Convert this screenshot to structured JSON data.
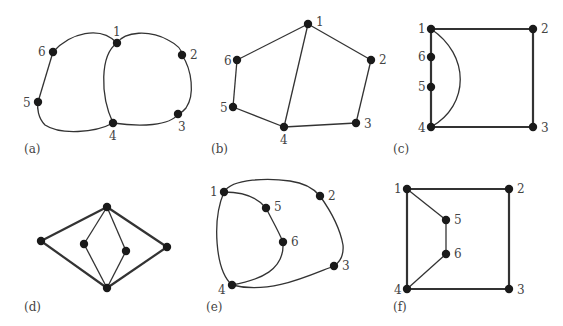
{
  "figure": {
    "panels": [
      {
        "id": "a",
        "caption": "(a)",
        "nodes": [
          {
            "label": "1"
          },
          {
            "label": "2"
          },
          {
            "label": "3"
          },
          {
            "label": "4"
          },
          {
            "label": "5"
          },
          {
            "label": "6"
          }
        ],
        "edges": [
          [
            "1",
            "2"
          ],
          [
            "2",
            "3"
          ],
          [
            "3",
            "4"
          ],
          [
            "4",
            "5"
          ],
          [
            "5",
            "6"
          ],
          [
            "6",
            "1"
          ],
          [
            "1",
            "4"
          ]
        ]
      },
      {
        "id": "b",
        "caption": "(b)",
        "nodes": [
          {
            "label": "1"
          },
          {
            "label": "2"
          },
          {
            "label": "3"
          },
          {
            "label": "4"
          },
          {
            "label": "5"
          },
          {
            "label": "6"
          }
        ],
        "edges": [
          [
            "1",
            "2"
          ],
          [
            "2",
            "3"
          ],
          [
            "3",
            "4"
          ],
          [
            "4",
            "5"
          ],
          [
            "5",
            "6"
          ],
          [
            "6",
            "1"
          ],
          [
            "1",
            "4"
          ]
        ]
      },
      {
        "id": "c",
        "caption": "(c)",
        "nodes": [
          {
            "label": "1"
          },
          {
            "label": "2"
          },
          {
            "label": "3"
          },
          {
            "label": "4"
          },
          {
            "label": "5"
          },
          {
            "label": "6"
          }
        ],
        "edges": [
          [
            "1",
            "2"
          ],
          [
            "2",
            "3"
          ],
          [
            "3",
            "4"
          ],
          [
            "4",
            "5"
          ],
          [
            "5",
            "6"
          ],
          [
            "6",
            "1"
          ],
          [
            "1",
            "4"
          ]
        ]
      },
      {
        "id": "d",
        "caption": "(d)",
        "nodes": [
          {
            "label": ""
          },
          {
            "label": ""
          },
          {
            "label": ""
          },
          {
            "label": ""
          },
          {
            "label": ""
          },
          {
            "label": ""
          }
        ],
        "edges": [
          [
            "top",
            "left"
          ],
          [
            "left",
            "bottom"
          ],
          [
            "bottom",
            "right"
          ],
          [
            "right",
            "top"
          ],
          [
            "top",
            "inner-left"
          ],
          [
            "inner-left",
            "bottom"
          ],
          [
            "top",
            "inner-right"
          ],
          [
            "inner-right",
            "bottom"
          ]
        ]
      },
      {
        "id": "e",
        "caption": "(e)",
        "nodes": [
          {
            "label": "1"
          },
          {
            "label": "2"
          },
          {
            "label": "3"
          },
          {
            "label": "4"
          },
          {
            "label": "5"
          },
          {
            "label": "6"
          }
        ],
        "edges": [
          [
            "1",
            "2"
          ],
          [
            "2",
            "3"
          ],
          [
            "3",
            "4"
          ],
          [
            "4",
            "1"
          ],
          [
            "1",
            "5"
          ],
          [
            "5",
            "6"
          ],
          [
            "6",
            "4"
          ]
        ]
      },
      {
        "id": "f",
        "caption": "(f)",
        "nodes": [
          {
            "label": "1"
          },
          {
            "label": "2"
          },
          {
            "label": "3"
          },
          {
            "label": "4"
          },
          {
            "label": "5"
          },
          {
            "label": "6"
          }
        ],
        "edges": [
          [
            "1",
            "2"
          ],
          [
            "2",
            "3"
          ],
          [
            "3",
            "4"
          ],
          [
            "4",
            "1"
          ],
          [
            "1",
            "5"
          ],
          [
            "5",
            "6"
          ],
          [
            "6",
            "4"
          ]
        ]
      }
    ]
  }
}
